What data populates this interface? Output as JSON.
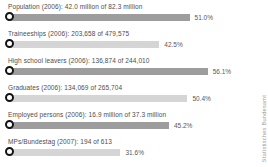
{
  "chart_data": {
    "type": "bar",
    "orientation": "horizontal",
    "title": "",
    "xlabel": "",
    "ylabel": "",
    "unit": "%",
    "xlim": [
      0,
      60
    ],
    "grid": false,
    "legend": "none",
    "categories": [
      "Population (2006)",
      "Traineeships (2006)",
      "High school leavers (2006)",
      "Graduates (2006)",
      "Employed persons (2006)",
      "MPs/Bundestag (2007)"
    ],
    "values": [
      51.0,
      42.5,
      56.1,
      50.4,
      45.2,
      31.6
    ],
    "annotations": [
      "42.0 million of 82.3 million",
      "203,658 of 479,575",
      "136,874 of 244,010",
      "134,069 of 265,704",
      "16.9 million of 37.3 million",
      "194 of 613"
    ]
  },
  "rows": [
    {
      "label": "Population (2006): 42.0 million of 82.3 million",
      "percent": 51.0,
      "percent_label": "51.0%"
    },
    {
      "label": "Traineeships (2006): 203,658 of 479,575",
      "percent": 42.5,
      "percent_label": "42.5%"
    },
    {
      "label": "High school leavers (2006): 136,874 of 244,010",
      "percent": 56.1,
      "percent_label": "56.1%"
    },
    {
      "label": "Graduates (2006): 134,069 of 265,704",
      "percent": 50.4,
      "percent_label": "50.4%"
    },
    {
      "label": "Employed persons (2006): 16.9 million of 37.3 million",
      "percent": 45.2,
      "percent_label": "45.2%"
    },
    {
      "label": "MPs/Bundestag (2007): 194 of 613",
      "percent": 31.6,
      "percent_label": "31.6%"
    }
  ],
  "watermark": "Statistisches Bundesamt",
  "colors": {
    "bar_dark": "#9d9d9d",
    "bar_light": "#d5d5d5",
    "marker_ring": "#141414",
    "marker_fill": "#ffffff",
    "label_text": "#4d4d4d",
    "percent_text": "#595959",
    "watermark_text": "#9a9a9a",
    "background": "#ffffff"
  },
  "layout": {
    "px_per_percent": 3.56
  }
}
